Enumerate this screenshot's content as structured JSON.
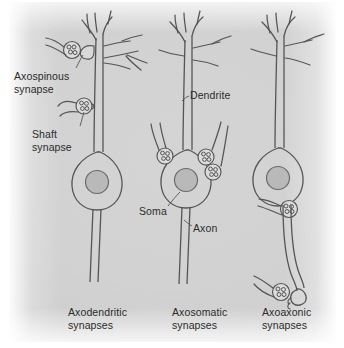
{
  "figure": {
    "background_color": "#d2d2d2",
    "ink_color": "#4a4a4a",
    "nucleus_color": "#b9b9b9"
  },
  "callouts": [
    {
      "id": "axospinous",
      "text": "Axospinous\nsynapse",
      "x": 14,
      "y": 70
    },
    {
      "id": "shaft",
      "text": "Shaft\nsynapse",
      "x": 32,
      "y": 128
    },
    {
      "id": "dendrite",
      "text": "Dendrite",
      "x": 190,
      "y": 89
    },
    {
      "id": "soma",
      "text": "Soma",
      "x": 139,
      "y": 205
    },
    {
      "id": "axon",
      "text": "Axon",
      "x": 193,
      "y": 222
    }
  ],
  "panels": [
    {
      "id": "axodendritic",
      "caption": "Axodendritic\nsynapses",
      "x": 68,
      "y": 306
    },
    {
      "id": "axosomatic",
      "caption": "Axosomatic\nsynapses",
      "x": 172,
      "y": 306
    },
    {
      "id": "axoaxonic",
      "caption": "Axoaxonic\nsynapses",
      "x": 262,
      "y": 306
    }
  ]
}
